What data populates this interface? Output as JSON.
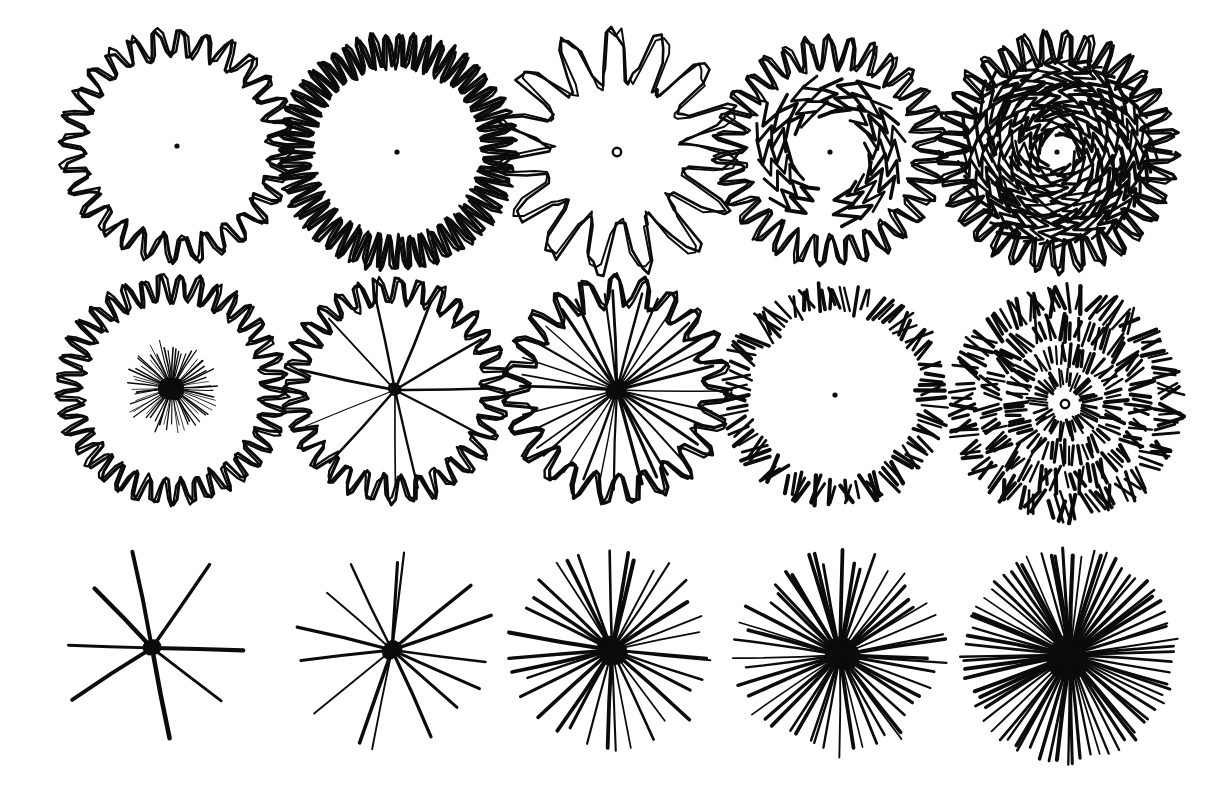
{
  "plate": {
    "title": "Entoptic Form-Constant Plate",
    "medium": "ink on paper",
    "background_color": "#ffffff",
    "ink_color": "#0b0b0b",
    "width": 1225,
    "height": 799,
    "grid": {
      "columns": 5,
      "rows": 3
    }
  },
  "chart_data": {
    "type": "scatter",
    "xlabel": "",
    "ylabel": "",
    "categories": [
      "col-1",
      "col-2",
      "col-3",
      "col-4",
      "col-5"
    ],
    "series": [
      {
        "name": "row-1-zigzag-rings",
        "values": [
          1,
          2,
          3,
          4,
          5
        ]
      },
      {
        "name": "row-2-rings-with-rays",
        "values": [
          6,
          7,
          8,
          9,
          10
        ]
      },
      {
        "name": "row-3-ray-bursts",
        "values": [
          11,
          12,
          13,
          14,
          15
        ]
      }
    ]
  },
  "figures": [
    {
      "id": "fig-1-1",
      "name": "sparse-zigzag-ring",
      "row": 1,
      "col": 1,
      "cx": 177,
      "cy": 146,
      "center_mark": "dot",
      "rings": [
        {
          "kind": "zigzag",
          "radius": 103,
          "teeth": 56,
          "amplitude": 13,
          "stroke": 3.1,
          "jitter": 3.4,
          "start_deg": 0,
          "span_deg": 360,
          "squiggle": 2
        }
      ],
      "rays": []
    },
    {
      "id": "fig-1-2",
      "name": "dense-zigzag-ring",
      "row": 1,
      "col": 2,
      "cx": 397,
      "cy": 152,
      "center_mark": "dot",
      "rings": [
        {
          "kind": "zigzag",
          "radius": 102,
          "teeth": 104,
          "amplitude": 17,
          "stroke": 3.4,
          "jitter": 3.0,
          "start_deg": 0,
          "span_deg": 360,
          "squiggle": 2
        }
      ],
      "rays": []
    },
    {
      "id": "fig-1-3",
      "name": "loose-thin-zigzag-ring",
      "row": 1,
      "col": 3,
      "cx": 617,
      "cy": 152,
      "center_mark": "circle",
      "rings": [
        {
          "kind": "zigzag",
          "radius": 96,
          "teeth": 30,
          "amplitude": 27,
          "stroke": 2.6,
          "jitter": 7.0,
          "start_deg": 0,
          "span_deg": 360,
          "squiggle": 3
        }
      ],
      "rays": []
    },
    {
      "id": "fig-1-4",
      "name": "double-zigzag-ring",
      "row": 1,
      "col": 4,
      "cx": 830,
      "cy": 152,
      "center_mark": "dot",
      "rings": [
        {
          "kind": "zigzag",
          "radius": 100,
          "teeth": 62,
          "amplitude": 15,
          "stroke": 3.0,
          "jitter": 3.6,
          "start_deg": 0,
          "span_deg": 360,
          "squiggle": 2
        },
        {
          "kind": "zigzag-marks",
          "radius": 58,
          "marks": 22,
          "amplitude": 19,
          "stroke": 3.0,
          "jitter": 6.0,
          "start_deg": 120,
          "span_deg": 330,
          "squiggle": 2
        }
      ],
      "rays": []
    },
    {
      "id": "fig-1-5",
      "name": "filled-zigzag-disc",
      "row": 1,
      "col": 5,
      "cx": 1057,
      "cy": 152,
      "center_mark": "dot",
      "rings": [
        {
          "kind": "zigzag",
          "radius": 104,
          "teeth": 66,
          "amplitude": 16,
          "stroke": 3.2,
          "jitter": 3.5,
          "start_deg": 0,
          "span_deg": 360,
          "squiggle": 2
        },
        {
          "kind": "zigzag-marks",
          "radius": 80,
          "marks": 44,
          "amplitude": 17,
          "stroke": 3.0,
          "jitter": 5.0,
          "start_deg": 6,
          "span_deg": 360,
          "squiggle": 2
        },
        {
          "kind": "zigzag-marks",
          "radius": 56,
          "marks": 30,
          "amplitude": 16,
          "stroke": 2.9,
          "jitter": 5.0,
          "start_deg": 14,
          "span_deg": 360,
          "squiggle": 2
        },
        {
          "kind": "zigzag-marks",
          "radius": 32,
          "marks": 18,
          "amplitude": 14,
          "stroke": 2.7,
          "jitter": 4.5,
          "start_deg": 26,
          "span_deg": 360,
          "squiggle": 2
        }
      ],
      "rays": []
    },
    {
      "id": "fig-2-1",
      "name": "zigzag-ring-with-fine-starburst",
      "row": 2,
      "col": 1,
      "cx": 172,
      "cy": 390,
      "center_mark": "none",
      "rings": [
        {
          "kind": "zigzag",
          "radius": 102,
          "teeth": 74,
          "amplitude": 13,
          "stroke": 3.0,
          "jitter": 3.2,
          "start_deg": 0,
          "span_deg": 360,
          "squiggle": 2
        }
      ],
      "rays": [
        {
          "count": 64,
          "r_inner": 3,
          "r_outer": 50,
          "stroke": 1.2,
          "jitter_deg": 2.6,
          "len_var": 0.3,
          "hub": 11,
          "cx_off": 0,
          "cy_off": -2
        }
      ]
    },
    {
      "id": "fig-2-2",
      "name": "zigzag-ring-with-ten-spokes",
      "row": 2,
      "col": 2,
      "cx": 395,
      "cy": 390,
      "center_mark": "none",
      "rings": [
        {
          "kind": "zigzag",
          "radius": 100,
          "teeth": 64,
          "amplitude": 13,
          "stroke": 3.0,
          "jitter": 3.2,
          "start_deg": 0,
          "span_deg": 360,
          "squiggle": 2
        }
      ],
      "rays": [
        {
          "count": 11,
          "r_inner": 2,
          "r_outer": 101,
          "stroke": 2.0,
          "jitter_deg": 12,
          "len_var": 0.07,
          "hub": 6,
          "cx_off": 0,
          "cy_off": 0
        }
      ]
    },
    {
      "id": "fig-2-3",
      "name": "zigzag-ring-with-many-spokes",
      "row": 2,
      "col": 3,
      "cx": 617,
      "cy": 390,
      "center_mark": "none",
      "rings": [
        {
          "kind": "zigzag",
          "radius": 99,
          "teeth": 46,
          "amplitude": 15,
          "stroke": 3.2,
          "jitter": 3.4,
          "start_deg": 0,
          "span_deg": 360,
          "squiggle": 2
        }
      ],
      "rays": [
        {
          "count": 32,
          "r_inner": 2,
          "r_outer": 100,
          "stroke": 2.3,
          "jitter_deg": 4,
          "len_var": 0.05,
          "hub": 9,
          "cx_off": 0,
          "cy_off": 0
        }
      ]
    },
    {
      "id": "fig-2-4",
      "name": "radial-dash-ring",
      "row": 2,
      "col": 4,
      "cx": 835,
      "cy": 395,
      "center_mark": "dot",
      "rings": [
        {
          "kind": "dashes",
          "radius": 99,
          "marks": 108,
          "amplitude": 23,
          "stroke": 3.0,
          "jitter": 4.0,
          "start_deg": 0,
          "span_deg": 360
        }
      ],
      "rays": []
    },
    {
      "id": "fig-2-5",
      "name": "concentric-dash-rings",
      "row": 2,
      "col": 5,
      "cx": 1065,
      "cy": 404,
      "center_mark": "circle",
      "rings": [
        {
          "kind": "dashes",
          "radius": 104,
          "marks": 112,
          "amplitude": 22,
          "stroke": 3.0,
          "jitter": 3.5,
          "start_deg": 0,
          "span_deg": 360
        },
        {
          "kind": "dashes",
          "radius": 76,
          "marks": 88,
          "amplitude": 20,
          "stroke": 3.0,
          "jitter": 3.5,
          "start_deg": 4,
          "span_deg": 360
        },
        {
          "kind": "dashes",
          "radius": 50,
          "marks": 62,
          "amplitude": 18,
          "stroke": 2.8,
          "jitter": 3.2,
          "start_deg": 9,
          "span_deg": 360
        },
        {
          "kind": "dashes",
          "radius": 26,
          "marks": 40,
          "amplitude": 15,
          "stroke": 2.6,
          "jitter": 3.0,
          "start_deg": 13,
          "span_deg": 360
        }
      ],
      "rays": []
    },
    {
      "id": "fig-3-1",
      "name": "eight-ray-burst",
      "row": 3,
      "col": 1,
      "cx": 152,
      "cy": 648,
      "center_mark": "none",
      "rings": [],
      "rays": [
        {
          "count": 8,
          "r_inner": 2,
          "r_outer": 104,
          "stroke": 3.2,
          "jitter_deg": 14,
          "len_var": 0.22,
          "hub": 8,
          "cx_off": 0,
          "cy_off": 0
        }
      ]
    },
    {
      "id": "fig-3-2",
      "name": "fourteen-ray-burst",
      "row": 3,
      "col": 2,
      "cx": 392,
      "cy": 650,
      "center_mark": "none",
      "rings": [],
      "rays": [
        {
          "count": 15,
          "r_inner": 2,
          "r_outer": 106,
          "stroke": 3.0,
          "jitter_deg": 11,
          "len_var": 0.2,
          "hub": 9,
          "cx_off": 0,
          "cy_off": 0
        }
      ]
    },
    {
      "id": "fig-3-3",
      "name": "thirty-ray-burst",
      "row": 3,
      "col": 3,
      "cx": 612,
      "cy": 650,
      "center_mark": "none",
      "rings": [],
      "rays": [
        {
          "count": 34,
          "r_inner": 2,
          "r_outer": 105,
          "stroke": 2.9,
          "jitter_deg": 5,
          "len_var": 0.17,
          "hub": 13,
          "cx_off": 0,
          "cy_off": 0
        }
      ]
    },
    {
      "id": "fig-3-4",
      "name": "fifty-ray-burst",
      "row": 3,
      "col": 4,
      "cx": 840,
      "cy": 655,
      "center_mark": "none",
      "rings": [],
      "rays": [
        {
          "count": 52,
          "r_inner": 2,
          "r_outer": 108,
          "stroke": 2.6,
          "jitter_deg": 4,
          "len_var": 0.2,
          "hub": 15,
          "cx_off": 0,
          "cy_off": 0
        }
      ]
    },
    {
      "id": "fig-3-5",
      "name": "seventy-ray-sunburst",
      "row": 3,
      "col": 5,
      "cx": 1070,
      "cy": 655,
      "center_mark": "none",
      "rings": [],
      "rays": [
        {
          "count": 74,
          "r_inner": 2,
          "r_outer": 110,
          "stroke": 2.8,
          "jitter_deg": 2.2,
          "len_var": 0.1,
          "hub": 20,
          "cx_off": 0,
          "cy_off": 0
        }
      ]
    }
  ]
}
